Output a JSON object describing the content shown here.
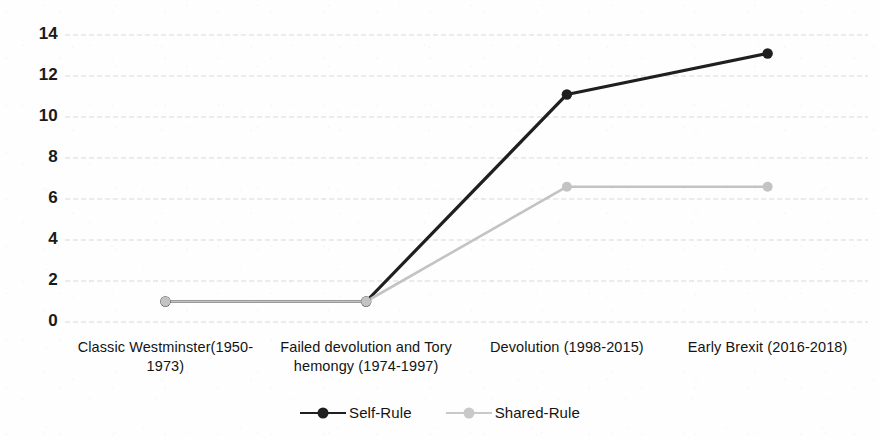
{
  "chart_data": {
    "type": "line",
    "title": "",
    "subtitle": "",
    "xlabel": "",
    "ylabel": "",
    "categories": [
      "Classic Westminster(1950-1973)",
      "Failed devolution and Tory hemongy (1974-1997)",
      "Devolution (1998-2015)",
      "Early Brexit (2016-2018)"
    ],
    "series": [
      {
        "name": "Self-Rule",
        "color": "#1f1f1f",
        "marker": "circle",
        "values": [
          1,
          1,
          11.1,
          13.1
        ]
      },
      {
        "name": "Shared-Rule",
        "color": "#c3c3c3",
        "marker": "circle",
        "values": [
          1,
          1,
          6.6,
          6.6
        ]
      }
    ],
    "ylim": [
      0,
      14
    ],
    "yticks": [
      0,
      2,
      4,
      6,
      8,
      10,
      12,
      14
    ],
    "ytick_labels": [
      "0",
      "2",
      "4",
      "6",
      "8",
      "10",
      "12",
      "14"
    ],
    "grid": {
      "horizontal": true,
      "vertical": false,
      "style": "dashed",
      "color": "#d9d9d9"
    },
    "legend": {
      "position": "bottom-center",
      "entries": [
        "Self-Rule",
        "Shared-Rule"
      ]
    },
    "axis_lines": {
      "x": false,
      "y": false
    },
    "background": "#ffffff"
  },
  "yticks": [
    {
      "label": "14",
      "value": 14
    },
    {
      "label": "12",
      "value": 12
    },
    {
      "label": "10",
      "value": 10
    },
    {
      "label": "8",
      "value": 8
    },
    {
      "label": "6",
      "value": 6
    },
    {
      "label": "4",
      "value": 4
    },
    {
      "label": "2",
      "value": 2
    },
    {
      "label": "0",
      "value": 0
    }
  ],
  "xticks": [
    {
      "line1": "Classic Westminster(1950-",
      "line2": "1973)"
    },
    {
      "line1": "Failed devolution and Tory",
      "line2": "hemongy (1974-1997)"
    },
    {
      "line1": "Devolution (1998-2015)",
      "line2": ""
    },
    {
      "line1": "Early Brexit (2016-2018)",
      "line2": ""
    }
  ],
  "legend": {
    "self_rule": "Self-Rule",
    "shared_rule": "Shared-Rule"
  }
}
